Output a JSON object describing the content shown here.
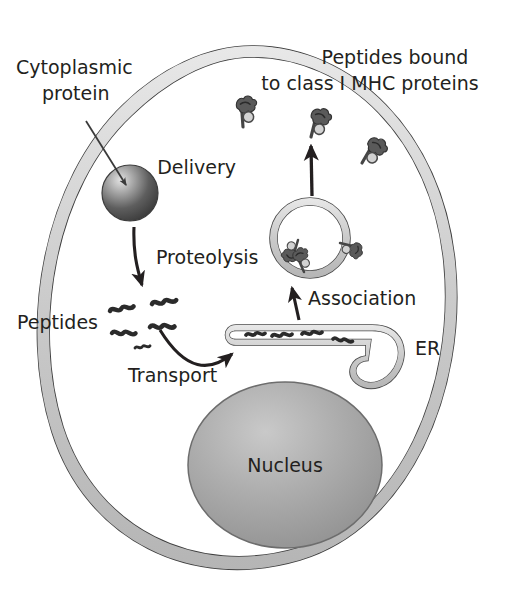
{
  "figure": {
    "background_color": "#ffffff",
    "width": 505,
    "height": 600
  },
  "labels": {
    "cytoplasmic_protein_line1": "Cytoplasmic",
    "cytoplasmic_protein_line2": "protein",
    "peptides_bound_line1": "Peptides bound",
    "peptides_bound_line2": "to class I MHC proteins",
    "delivery": "Delivery",
    "proteolysis": "Proteolysis",
    "peptides": "Peptides",
    "transport": "Transport",
    "association": "Association",
    "er": "ER",
    "nucleus": "Nucleus"
  },
  "colors": {
    "outline": "#3a3a3a",
    "membrane_fill": "#cfcfcf",
    "nucleus_fill": "#9a9a9a",
    "nucleus_highlight": "#c4c4c4",
    "protein_dark": "#4a4a4a",
    "protein_highlight": "#d8d8d8",
    "peptide_stroke": "#2b2b2b",
    "mhc_body": "#5a5a5a",
    "mhc_bead": "#c8c8c8",
    "text": "#231f20",
    "cell_interior": "#ffffff"
  },
  "structures": {
    "cell_membrane": "plasma membrane of the cell, drawn as a closed double-line band",
    "nucleus": "large gray ellipse in lower middle of the cell",
    "er": "endoplasmic reticulum, a hook shaped tubular cisterna containing peptides",
    "vesicle": "transport vesicle containing class I MHC proteins loaded with peptides",
    "cytoplasmic_protein": "shaded sphere representing a cytoplasmic protein",
    "free_peptides": "short dark wavy lines representing free cytosolic peptides",
    "surface_mhc_count": 3,
    "vesicle_mhc_count": 3,
    "er_peptide_count": 4,
    "free_peptide_count": 5
  },
  "arrows": [
    {
      "name": "pointer-to-protein",
      "label": ""
    },
    {
      "name": "proteolysis-arrow",
      "label": "Proteolysis"
    },
    {
      "name": "transport-arrow",
      "label": "Transport"
    },
    {
      "name": "association-arrow",
      "label": "Association"
    },
    {
      "name": "delivery-arrow",
      "label": "Delivery"
    }
  ]
}
